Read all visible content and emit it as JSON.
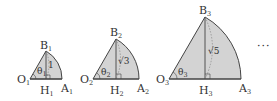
{
  "figure": {
    "colors": {
      "fill": "#d3d3d3",
      "stroke": "#444444",
      "dashed": "#777777",
      "text": "#333333"
    },
    "figures": [
      {
        "index": 1,
        "labels": {
          "O": "O",
          "A": "A",
          "B": "B",
          "H": "H",
          "sub": "1"
        },
        "angle_label": "θ",
        "angle_sub": "1",
        "height_label": "1",
        "geom": {
          "ox": 30,
          "base": 79,
          "r": 32,
          "bx": 46,
          "by": 51
        }
      },
      {
        "index": 2,
        "labels": {
          "O": "O",
          "A": "A",
          "B": "B",
          "H": "H",
          "sub": "2"
        },
        "angle_label": "θ",
        "angle_sub": "2",
        "height_label": "√3",
        "geom": {
          "ox": 93,
          "base": 79,
          "r": 46,
          "bx": 116,
          "by": 39
        }
      },
      {
        "index": 3,
        "labels": {
          "O": "O",
          "A": "A",
          "B": "B",
          "H": "H",
          "sub": "3"
        },
        "angle_label": "θ",
        "angle_sub": "3",
        "height_label": "√5",
        "geom": {
          "ox": 169,
          "base": 79,
          "r": 72,
          "bx": 205,
          "by": 17
        }
      }
    ],
    "continuation": "···"
  }
}
